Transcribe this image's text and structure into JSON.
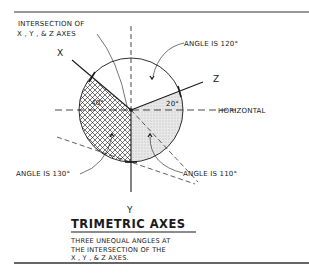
{
  "diagram": {
    "callouts": {
      "intersection_line1": "INTERSECTION OF",
      "intersection_line2": "X , Y , & Z  AXES",
      "angle_120": "ANGLE IS 120°",
      "angle_130": "ANGLE IS 130°",
      "angle_110": "ANGLE IS 110°",
      "horizontal": "HORIZONTAL"
    },
    "axes": {
      "x": "X",
      "y": "Y",
      "z": "Z"
    },
    "angle_marks": {
      "x_to_horizontal": "40°",
      "z_to_horizontal": "20°"
    },
    "angles_deg": {
      "xz": 120,
      "xy": 130,
      "zy": 110,
      "x_above_horizontal": 40,
      "z_above_horizontal": 20
    },
    "caption": {
      "title": "TRIMETRIC AXES",
      "line1": "THREE UNEQUAL ANGLES AT",
      "line2": "THE INTERSECTION OF THE",
      "line3": "X , Y , & Z  AXES."
    },
    "colors": {
      "ink": "#1a1a1a",
      "stipple": "#d9d9d9",
      "background": "#ffffff"
    }
  }
}
